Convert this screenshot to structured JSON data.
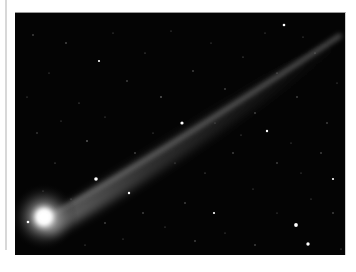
{
  "image": {
    "subject": "comet with long ion tail against star field",
    "alt": "Comet photograph",
    "colors": {
      "frame": "#ffffff",
      "sky": "#040404",
      "coma": "#ffffff",
      "tail": "#bdbdbd",
      "left_rule": "#d8d8d8"
    },
    "comet": {
      "head_x": 29,
      "head_y": 204,
      "tail_end_x": 325,
      "tail_end_y": 20
    },
    "bright_stars": [
      {
        "x": 81,
        "y": 166,
        "r": 1.8
      },
      {
        "x": 167,
        "y": 110,
        "r": 1.6
      },
      {
        "x": 281,
        "y": 212,
        "r": 1.9
      },
      {
        "x": 293,
        "y": 231,
        "r": 1.7
      },
      {
        "x": 13,
        "y": 209,
        "r": 1.3
      },
      {
        "x": 252,
        "y": 118,
        "r": 1.2
      },
      {
        "x": 84,
        "y": 48,
        "r": 1.1
      },
      {
        "x": 114,
        "y": 180,
        "r": 1.2
      },
      {
        "x": 199,
        "y": 200,
        "r": 1.1
      },
      {
        "x": 269,
        "y": 12,
        "r": 1.3
      },
      {
        "x": 318,
        "y": 166,
        "r": 1.1
      }
    ]
  }
}
